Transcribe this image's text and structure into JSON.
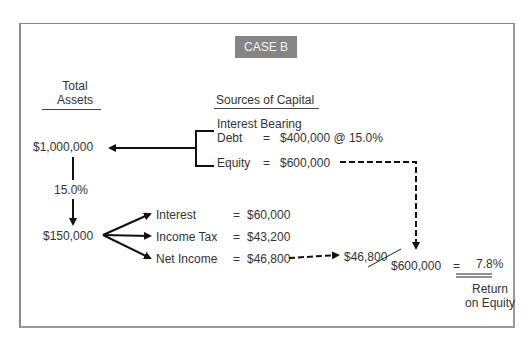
{
  "case_label": "CASE B",
  "headers": {
    "total_assets_line1": "Total",
    "total_assets_line2": "Assets",
    "sources_of_capital": "Sources of Capital"
  },
  "assets": {
    "total": "$1,000,000",
    "rate": "15.0%",
    "earnings": "$150,000"
  },
  "capital": {
    "debt_label_line1": "Interest Bearing",
    "debt_label_line2": "Debt",
    "debt_eq": "=",
    "debt_value": "$400,000 @ 15.0%",
    "equity_label": "Equity",
    "equity_eq": "=",
    "equity_value": "$600,000"
  },
  "distribution": [
    {
      "label": "Interest",
      "eq": "=",
      "value": "$60,000"
    },
    {
      "label": "Income Tax",
      "eq": "=",
      "value": "$43,200"
    },
    {
      "label": "Net Income",
      "eq": "=",
      "value": "$46,800"
    }
  ],
  "roe": {
    "numerator": "$46,800",
    "denominator": "$600,000",
    "eq": "=",
    "result": "7.8%",
    "label_line1": "Return",
    "label_line2": "on Equity"
  }
}
